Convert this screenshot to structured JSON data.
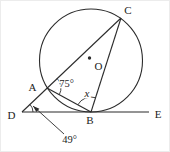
{
  "figure": {
    "width": 170,
    "height": 152,
    "background": "#ffffff",
    "line_color": "#2b2b2b",
    "text_color": "#222222",
    "circle": {
      "cx": 90,
      "cy": 59.5,
      "r": 51.5
    },
    "center_dot": {
      "cx": 88.5,
      "cy": 57,
      "r": 1.7
    },
    "segments": [
      {
        "name": "segment-D-C",
        "x1": 21,
        "y1": 111,
        "x2": 120,
        "y2": 17
      },
      {
        "name": "segment-C-B",
        "x1": 120,
        "y1": 17,
        "x2": 90,
        "y2": 111
      },
      {
        "name": "segment-A-B",
        "x1": 46,
        "y1": 87,
        "x2": 90,
        "y2": 111
      },
      {
        "name": "segment-D-E",
        "x1": 21,
        "y1": 111,
        "x2": 148,
        "y2": 111
      }
    ],
    "angle_arcs": [
      {
        "name": "angle-arc-A",
        "cx": 46,
        "cy": 87,
        "r": 14,
        "start": -43.3,
        "end": 28.6
      },
      {
        "name": "angle-arc-B",
        "cx": 90,
        "cy": 111,
        "r": 15,
        "start": -151.4,
        "end": -72.2
      },
      {
        "name": "angle-arc-D",
        "cx": 21,
        "cy": 111,
        "r": 11,
        "start": -43.5,
        "end": 0
      }
    ],
    "leader_arrow": {
      "x1": 63,
      "y1": 133,
      "x2": 32,
      "y2": 105,
      "head_length": 6.5,
      "head_half_width": 2.3
    },
    "labels": [
      {
        "name": "point-label-A",
        "text": "A",
        "x": 31.5,
        "y": 90,
        "size": 11
      },
      {
        "name": "point-label-B",
        "text": "B",
        "x": 89,
        "y": 123,
        "size": 11
      },
      {
        "name": "point-label-C",
        "text": "C",
        "x": 127,
        "y": 12.5,
        "size": 11
      },
      {
        "name": "point-label-D",
        "text": "D",
        "x": 10.5,
        "y": 118,
        "size": 11
      },
      {
        "name": "point-label-E",
        "text": "E",
        "x": 157,
        "y": 117,
        "size": 11
      },
      {
        "name": "center-label-O",
        "text": "O",
        "x": 97.5,
        "y": 69,
        "size": 11
      },
      {
        "name": "angle-label-CAB",
        "text": "75°",
        "x": 65.5,
        "y": 85.5,
        "size": 10.5
      },
      {
        "name": "angle-label-ABC",
        "text": "x",
        "x": 86,
        "y": 95.5,
        "size": 11,
        "italic": true
      },
      {
        "name": "angle-label-ADB",
        "text": "49°",
        "x": 68.5,
        "y": 141.5,
        "size": 10.5
      }
    ]
  }
}
